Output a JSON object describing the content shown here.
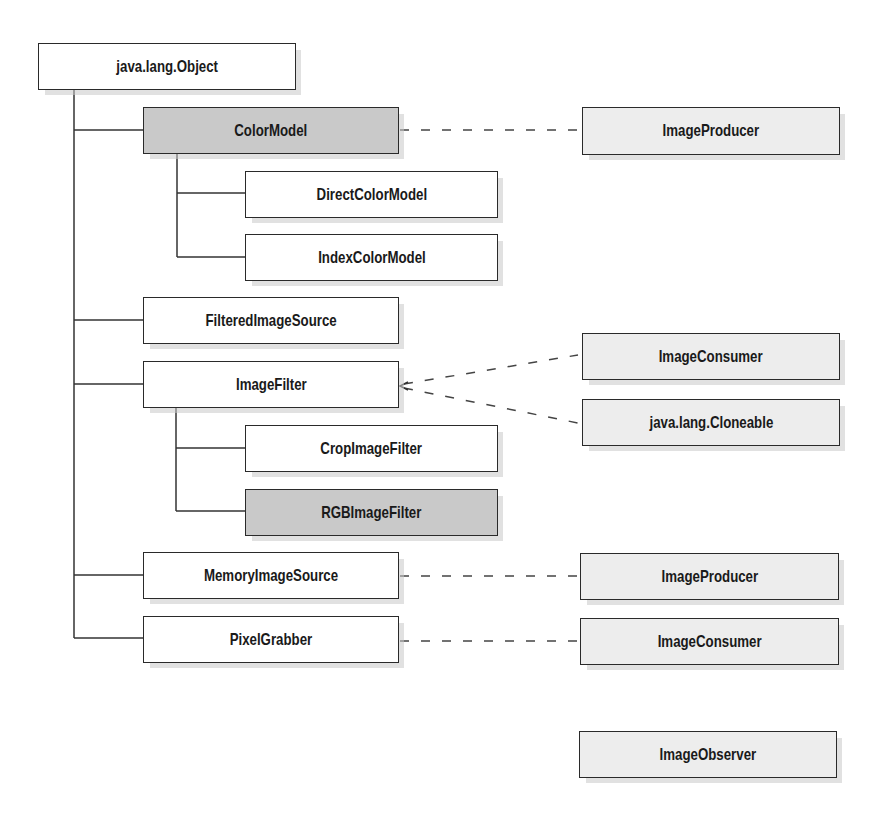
{
  "diagram": {
    "colors": {
      "line": "#333333",
      "class_fill": "#ffffff",
      "abstract_fill": "#c9c9c9",
      "interface_fill": "#ededed"
    },
    "nodes": {
      "object": {
        "label": "java.lang.Object",
        "kind": "class"
      },
      "color_model": {
        "label": "ColorModel",
        "kind": "abstract"
      },
      "direct_color_model": {
        "label": "DirectColorModel",
        "kind": "class"
      },
      "index_color_model": {
        "label": "IndexColorModel",
        "kind": "class"
      },
      "filtered_image_source": {
        "label": "FilteredImageSource",
        "kind": "class"
      },
      "image_filter": {
        "label": "ImageFilter",
        "kind": "class"
      },
      "crop_image_filter": {
        "label": "CropImageFilter",
        "kind": "class"
      },
      "rgb_image_filter": {
        "label": "RGBImageFilter",
        "kind": "abstract"
      },
      "memory_image_source": {
        "label": "MemoryImageSource",
        "kind": "class"
      },
      "pixel_grabber": {
        "label": "PixelGrabber",
        "kind": "class"
      },
      "image_producer_1": {
        "label": "ImageProducer",
        "kind": "interface"
      },
      "image_consumer_1": {
        "label": "ImageConsumer",
        "kind": "interface"
      },
      "cloneable": {
        "label": "java.lang.Cloneable",
        "kind": "interface"
      },
      "image_producer_2": {
        "label": "ImageProducer",
        "kind": "interface"
      },
      "image_consumer_2": {
        "label": "ImageConsumer",
        "kind": "interface"
      },
      "image_observer": {
        "label": "ImageObserver",
        "kind": "interface"
      }
    },
    "inheritance": [
      [
        "object",
        "color_model"
      ],
      [
        "color_model",
        "direct_color_model"
      ],
      [
        "color_model",
        "index_color_model"
      ],
      [
        "object",
        "filtered_image_source"
      ],
      [
        "object",
        "image_filter"
      ],
      [
        "image_filter",
        "crop_image_filter"
      ],
      [
        "image_filter",
        "rgb_image_filter"
      ],
      [
        "object",
        "memory_image_source"
      ],
      [
        "object",
        "pixel_grabber"
      ]
    ],
    "implements": [
      [
        "color_model",
        "image_producer_1"
      ],
      [
        "image_filter",
        "image_consumer_1"
      ],
      [
        "image_filter",
        "cloneable"
      ],
      [
        "memory_image_source",
        "image_producer_2"
      ],
      [
        "pixel_grabber",
        "image_consumer_2"
      ]
    ]
  }
}
